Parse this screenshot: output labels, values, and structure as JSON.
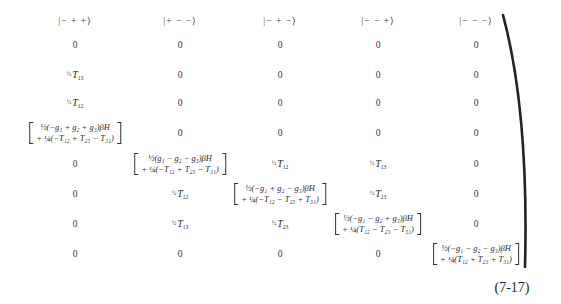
{
  "matrix": {
    "column_headers": [
      "|− + +⟩",
      "|+ − −⟩",
      "|− + −⟩",
      "|− − +⟩",
      "|− − −⟩"
    ],
    "rows": [
      [
        "0",
        "0",
        "0",
        "0",
        "0"
      ],
      [
        "½T13",
        "0",
        "0",
        "0",
        "0"
      ],
      [
        "½T12",
        "0",
        "0",
        "0",
        "0"
      ],
      [
        "diag1",
        "0",
        "0",
        "0",
        "0"
      ],
      [
        "0",
        "diag2",
        "½T12",
        "½T13",
        "0"
      ],
      [
        "0",
        "½T12",
        "diag3",
        "½T23",
        "0"
      ],
      [
        "0",
        "½T13",
        "½T23",
        "diag4",
        "0"
      ],
      [
        "0",
        "0",
        "0",
        "0",
        "diag5"
      ]
    ],
    "half": "½",
    "t_symbol": "T",
    "subscripts": {
      "r1c0": "13",
      "r2c0": "12",
      "r4c2": "12",
      "r4c3": "13",
      "r5c1": "12",
      "r5c3": "23",
      "r6c1": "13",
      "r6c2": "23"
    },
    "diagonal": {
      "d1": {
        "line1": "½(−g₁ + g₂ + g₃)βH",
        "line2": "+ ¼(−T₁₂ + T₂₃ − T₃₁)"
      },
      "d2": {
        "line1": "½(g₁ − g₂ − g₃)βH",
        "line2": "+ ¼(−T₁₂ + T₂₃ − T₃₁)"
      },
      "d3": {
        "line1": "½(−g₁ + g₂ − g₃)βH",
        "line2": "+ ¼(−T₁₂ − T₂₃ + T₃₁)"
      },
      "d4": {
        "line1": "½(−g₁ − g₂ + g₃)βH",
        "line2": "+ ¼(T₁₂ − T₂₃ − T₃₁)"
      },
      "d5": {
        "line1": "½(−g₁ − g₂ − g₃)βH",
        "line2": "+ ¼(T₁₂ + T₂₃ + T₃₁)"
      }
    },
    "zero": "0"
  },
  "equation_number": "(7-17)"
}
